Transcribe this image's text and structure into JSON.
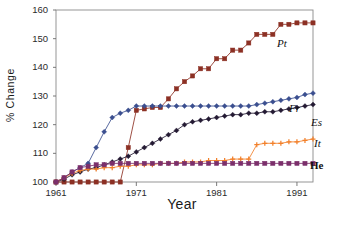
{
  "chart_data": {
    "type": "line",
    "title": "",
    "xlabel": "Year",
    "ylabel": "% Change",
    "xlim": [
      1961,
      1993
    ],
    "ylim": [
      100,
      160
    ],
    "grid": false,
    "legend_position": "right-inline-labels",
    "x_ticks": [
      1961,
      1971,
      1981,
      1991
    ],
    "y_ticks": [
      100,
      110,
      120,
      130,
      140,
      150,
      160
    ],
    "x": [
      1961,
      1962,
      1963,
      1964,
      1965,
      1966,
      1967,
      1968,
      1969,
      1970,
      1971,
      1972,
      1973,
      1974,
      1975,
      1976,
      1977,
      1978,
      1979,
      1980,
      1981,
      1982,
      1983,
      1984,
      1985,
      1986,
      1987,
      1988,
      1989,
      1990,
      1991,
      1992,
      1993
    ],
    "series": [
      {
        "name": "Pt",
        "label": "Pt",
        "color": "#8c3024",
        "marker": "square",
        "values": [
          100,
          100,
          100,
          100,
          100,
          100,
          100,
          100,
          100,
          112,
          125,
          125.5,
          126,
          126,
          129,
          132.5,
          135,
          137,
          139.5,
          139.5,
          143,
          143,
          146,
          146,
          148.5,
          151.5,
          151.5,
          151.5,
          155,
          155,
          155.5,
          155.5,
          155.5
        ]
      },
      {
        "name": "Fr",
        "label": "Fr",
        "color": "#3b4f8f",
        "marker": "diamond",
        "values": [
          100,
          101.5,
          103.5,
          105,
          106.5,
          112,
          117.5,
          122.5,
          124,
          125,
          126.5,
          126.5,
          126.5,
          126.5,
          126.5,
          126.5,
          126.5,
          126.5,
          126.5,
          126.5,
          126.5,
          126.5,
          126.5,
          126.5,
          126.5,
          127,
          127.5,
          128,
          128.5,
          129,
          129.5,
          130.5,
          131
        ]
      },
      {
        "name": "Es",
        "label": "Es",
        "color": "#241a33",
        "marker": "diamond",
        "values": [
          100,
          101,
          102.5,
          103.5,
          104.5,
          105,
          106,
          107,
          108,
          109,
          110.5,
          112,
          113.5,
          115,
          116.5,
          118,
          120,
          121,
          121.5,
          122,
          122.5,
          123,
          123.5,
          123.5,
          124,
          124,
          124.5,
          124.5,
          125,
          125.5,
          126,
          126.5,
          127
        ]
      },
      {
        "name": "It",
        "label": "It",
        "color": "#f2802a",
        "marker": "plus",
        "values": [
          100,
          101.5,
          103,
          104,
          104.5,
          104.5,
          105,
          105,
          105.5,
          105.5,
          106,
          106,
          106,
          106.5,
          106.5,
          106.5,
          107,
          107,
          107,
          107.5,
          107.5,
          107.5,
          108,
          108,
          108,
          113,
          113.5,
          113.5,
          113.5,
          114,
          114,
          114.5,
          115
        ]
      },
      {
        "name": "He",
        "label": "He",
        "color": "#7b2f6b",
        "marker": "square",
        "values": [
          100,
          101.5,
          103.5,
          105,
          105.5,
          106,
          106,
          106.5,
          106.5,
          106.5,
          106.5,
          106.5,
          106.5,
          106.5,
          106.5,
          106.5,
          106.5,
          106.5,
          106.5,
          106.5,
          106.5,
          106.5,
          106.5,
          106.5,
          106.5,
          106.5,
          106.5,
          106.5,
          106.5,
          106.5,
          106.5,
          106.5,
          106.5
        ]
      }
    ]
  },
  "axes": {
    "y_title": "% Change",
    "x_title": "Year",
    "y_tick_labels": [
      "160",
      "150",
      "140",
      "130",
      "120",
      "110",
      "100"
    ],
    "x_tick_labels": [
      "1961",
      "1971",
      "1981",
      "1991"
    ]
  },
  "series_labels": [
    {
      "text": "Pt",
      "name": "series-label-pt"
    },
    {
      "text": "Fr",
      "name": "series-label-fr"
    },
    {
      "text": "Es",
      "name": "series-label-es"
    },
    {
      "text": "It",
      "name": "series-label-it"
    },
    {
      "text": "He",
      "name": "series-label-he"
    }
  ]
}
